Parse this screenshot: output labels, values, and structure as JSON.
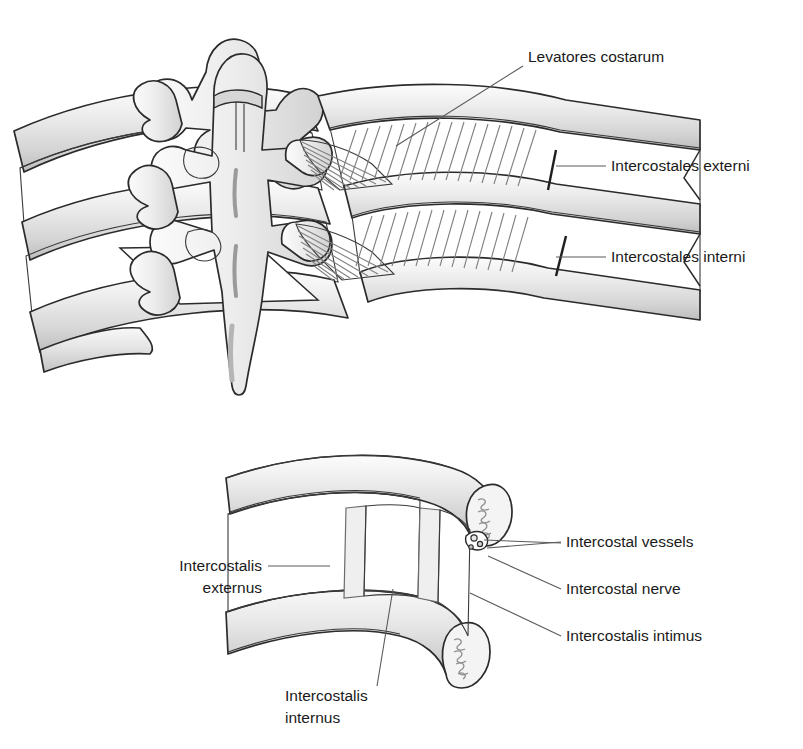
{
  "figure": {
    "title_fragment": "",
    "kind": "anatomical-illustration",
    "palette": {
      "outline": "#2b2b2b",
      "bone_light": "#f2f2f2",
      "bone_mid": "#e2e2e2",
      "bone_shadow": "#c9c9c9",
      "muscle_light": "#ebebeb",
      "muscle_hatch": "#8a8a8a",
      "leader": "#5a5a5a",
      "text": "#1a1a1a",
      "background": "#ffffff"
    }
  },
  "panels": [
    {
      "id": "upper",
      "name": "posterior-view-vertebrae-ribs",
      "description": "Posterior view of thoracic vertebrae with ribs, levatores costarum and intercostal muscles"
    },
    {
      "id": "lower",
      "name": "intercostal-space-cutaway",
      "description": "Cutaway of an intercostal space between two ribs showing muscle layers and neurovascular bundle"
    }
  ],
  "labels": {
    "upper": [
      {
        "id": "levatores-costarum",
        "text": "Levatores costarum",
        "anchor": "start",
        "x": 528,
        "y": 62,
        "leader": [
          [
            523,
            66
          ],
          [
            396,
            146
          ]
        ]
      },
      {
        "id": "intercostales-externi",
        "text": "Intercostales externi",
        "anchor": "start",
        "x": 611,
        "y": 171,
        "leader": [
          [
            606,
            166
          ],
          [
            556,
            166
          ]
        ]
      },
      {
        "id": "intercostales-interni",
        "text": "Intercostales interni",
        "anchor": "start",
        "x": 611,
        "y": 262,
        "leader": [
          [
            606,
            257
          ],
          [
            556,
            257
          ]
        ]
      }
    ],
    "lower": [
      {
        "id": "intercostalis-externus",
        "text_lines": [
          "Intercostalis",
          "externus"
        ],
        "anchor": "end",
        "x": 262,
        "y": 571,
        "leader": [
          [
            268,
            566
          ],
          [
            330,
            566
          ]
        ]
      },
      {
        "id": "intercostal-vessels",
        "text": "Intercostal vessels",
        "anchor": "start",
        "x": 566,
        "y": 547,
        "leader": [
          [
            561,
            542
          ],
          [
            487,
            548
          ]
        ]
      },
      {
        "id": "intercostal-nerve",
        "text": "Intercostal nerve",
        "anchor": "start",
        "x": 566,
        "y": 594,
        "leader": [
          [
            561,
            589
          ],
          [
            488,
            556
          ]
        ]
      },
      {
        "id": "intercostalis-intimus",
        "text": "Intercostalis intimus",
        "anchor": "start",
        "x": 566,
        "y": 641,
        "leader": [
          [
            561,
            636
          ],
          [
            470,
            593
          ]
        ]
      },
      {
        "id": "intercostalis-internus",
        "text_lines": [
          "Intercostalis",
          "internus"
        ],
        "anchor": "start",
        "x": 285,
        "y": 701,
        "leader": [
          [
            377,
            686
          ],
          [
            393,
            589
          ]
        ]
      }
    ]
  }
}
